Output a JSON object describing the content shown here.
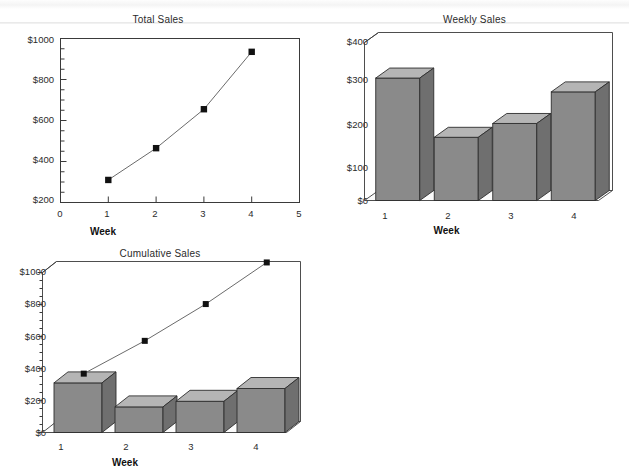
{
  "page": {
    "background_color": "#ffffff",
    "scan_band_color": "#f4f4f4"
  },
  "charts": [
    {
      "id": "total-sales",
      "title": "Total Sales",
      "xlabel": "Week",
      "ylabel": "",
      "y_ticks": [
        "$200",
        "$400",
        "$600",
        "$800",
        "$1000"
      ],
      "x_ticks": [
        "0",
        "1",
        "2",
        "3",
        "4",
        "5"
      ]
    },
    {
      "id": "weekly-sales",
      "title": "Weekly Sales",
      "xlabel": "Week",
      "ylabel": "",
      "y_ticks": [
        "$0",
        "$100",
        "$200",
        "$300",
        "$400"
      ],
      "x_ticks": [
        "1",
        "2",
        "3",
        "4"
      ]
    },
    {
      "id": "cumulative-sales",
      "title": "Cumulative Sales",
      "xlabel": "Week",
      "ylabel": "",
      "y_ticks": [
        "$0",
        "$200",
        "$400",
        "$600",
        "$800",
        "$1000"
      ],
      "x_ticks": [
        "1",
        "2",
        "3",
        "4"
      ]
    }
  ],
  "chart_data": [
    {
      "type": "line",
      "id": "total-sales",
      "title": "Total Sales",
      "xlabel": "Week",
      "ylabel": "",
      "x": [
        1,
        2,
        3,
        4
      ],
      "values": [
        310,
        465,
        655,
        935
      ],
      "xlim": [
        0,
        5
      ],
      "ylim": [
        200,
        1000
      ],
      "x_ticks": [
        0,
        1,
        2,
        3,
        4,
        5
      ],
      "y_ticks": [
        200,
        400,
        600,
        800,
        1000
      ],
      "y_tick_labels": [
        "$200",
        "$400",
        "$600",
        "$800",
        "$1000"
      ],
      "y_minor_step": 50,
      "grid": false,
      "legend": false,
      "marker": "square",
      "marker_color": "#111111",
      "line_color": "#6b6b6b"
    },
    {
      "type": "bar",
      "id": "weekly-sales",
      "title": "Weekly Sales",
      "xlabel": "Week",
      "ylabel": "",
      "categories": [
        "1",
        "2",
        "3",
        "4"
      ],
      "values": [
        310,
        160,
        195,
        275
      ],
      "ylim": [
        0,
        400
      ],
      "y_ticks": [
        0,
        100,
        200,
        300,
        400
      ],
      "y_tick_labels": [
        "$0",
        "$100",
        "$200",
        "$300",
        "$400"
      ],
      "grid": false,
      "legend": false,
      "style": "3d",
      "bar_face_color": "#8a8a8a",
      "bar_top_color": "#b5b5b5",
      "bar_side_color": "#6f6f6f"
    },
    {
      "type": "bar",
      "id": "cumulative-sales",
      "title": "Cumulative Sales",
      "xlabel": "Week",
      "ylabel": "",
      "categories": [
        "1",
        "2",
        "3",
        "4"
      ],
      "values": [
        310,
        160,
        195,
        275
      ],
      "series": [
        {
          "name": "Weekly Sales",
          "type": "bar",
          "values": [
            310,
            160,
            195,
            275
          ]
        },
        {
          "name": "Cumulative Sales",
          "type": "line",
          "values": [
            330,
            535,
            765,
            1025
          ]
        }
      ],
      "ylim": [
        0,
        1000
      ],
      "y_ticks": [
        0,
        200,
        400,
        600,
        800,
        1000
      ],
      "y_tick_labels": [
        "$0",
        "$200",
        "$400",
        "$600",
        "$800",
        "$1000"
      ],
      "y_minor_step": 50,
      "grid": false,
      "legend": false,
      "style": "3d",
      "bar_face_color": "#8a8a8a",
      "bar_top_color": "#b5b5b5",
      "bar_side_color": "#6f6f6f",
      "marker": "square",
      "marker_color": "#111111",
      "line_color": "#6b6b6b"
    }
  ]
}
